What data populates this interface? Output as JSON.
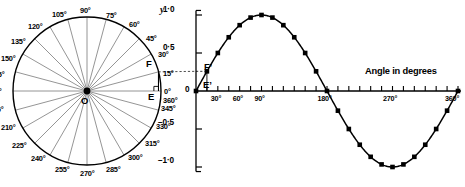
{
  "figure": {
    "width": 465,
    "height": 187,
    "background": "#ffffff",
    "ink": "#000000",
    "spoke_color": "#7a7a7a"
  },
  "circle_diagram": {
    "center_label": "O",
    "center": {
      "x": 87,
      "y": 91
    },
    "radius": 74,
    "spoke_step_degrees": 15,
    "point_labels": [
      {
        "name": "F",
        "text": "F"
      },
      {
        "name": "E",
        "text": "E"
      }
    ],
    "right_angle_marker": true,
    "angle_labels": [
      {
        "value": 0,
        "text": "0°",
        "x": 164,
        "y": 88
      },
      {
        "value": 15,
        "text": "15°",
        "x": 163,
        "y": 70
      },
      {
        "value": 30,
        "text": "30°",
        "x": 158,
        "y": 51
      },
      {
        "value": 45,
        "text": "45°",
        "x": 146,
        "y": 35
      },
      {
        "value": 60,
        "text": "60°",
        "x": 129,
        "y": 21
      },
      {
        "value": 75,
        "text": "75°",
        "x": 106,
        "y": 12
      },
      {
        "value": 90,
        "text": "90°",
        "x": 80,
        "y": 7
      },
      {
        "value": 105,
        "text": "105°",
        "x": 52,
        "y": 11
      },
      {
        "value": 120,
        "text": "120°",
        "x": 28,
        "y": 23
      },
      {
        "value": 135,
        "text": "135°",
        "x": 11,
        "y": 38
      },
      {
        "value": 150,
        "text": "150°",
        "x": 1,
        "y": 55
      },
      {
        "value": 165,
        "text": "165°",
        "x": -10,
        "y": 71
      },
      {
        "value": 180,
        "text": "180°",
        "x": -13,
        "y": 88
      },
      {
        "value": 195,
        "text": "195°",
        "x": -11,
        "y": 106
      },
      {
        "value": 210,
        "text": "210°",
        "x": 1,
        "y": 124
      },
      {
        "value": 225,
        "text": "225°",
        "x": 12,
        "y": 142
      },
      {
        "value": 240,
        "text": "240°",
        "x": 31,
        "y": 155
      },
      {
        "value": 255,
        "text": "255°",
        "x": 55,
        "y": 166
      },
      {
        "value": 270,
        "text": "270°",
        "x": 80,
        "y": 170
      },
      {
        "value": 285,
        "text": "285°",
        "x": 106,
        "y": 166
      },
      {
        "value": 300,
        "text": "300°",
        "x": 128,
        "y": 154
      },
      {
        "value": 315,
        "text": "315°",
        "x": 145,
        "y": 140
      },
      {
        "value": 330,
        "text": "330°",
        "x": 156,
        "y": 123
      },
      {
        "value": 345,
        "text": "345°",
        "x": 161,
        "y": 105
      },
      {
        "value": 360,
        "text": "360°",
        "x": 163,
        "y": 97
      }
    ]
  },
  "chart_data": {
    "type": "line",
    "title": "",
    "xlabel": "Angle in degrees",
    "ylabel": "y",
    "xlim": [
      0,
      360
    ],
    "ylim": [
      -1.0,
      1.0
    ],
    "grid": false,
    "legend": null,
    "x_tick_step": 15,
    "x_labeled_ticks": [
      {
        "value": 30,
        "text": "30°"
      },
      {
        "value": 60,
        "text": "60°"
      },
      {
        "value": 90,
        "text": "90°"
      },
      {
        "value": 180,
        "text": "180°"
      },
      {
        "value": 270,
        "text": "270°"
      },
      {
        "value": 360,
        "text": "360°"
      }
    ],
    "y_ticks": [
      {
        "value": 1.0,
        "text": "1·0"
      },
      {
        "value": 0.5,
        "text": "0·5"
      },
      {
        "value": 0.0,
        "text": "0"
      },
      {
        "value": -0.5,
        "text": "−0·5"
      },
      {
        "value": -1.0,
        "text": "−1·0"
      }
    ],
    "series": [
      {
        "name": "sine",
        "marker": "filled-square",
        "x": [
          0,
          15,
          30,
          45,
          60,
          75,
          90,
          105,
          120,
          135,
          150,
          165,
          180,
          195,
          210,
          225,
          240,
          255,
          270,
          285,
          300,
          315,
          330,
          345,
          360
        ],
        "values": [
          0.0,
          0.259,
          0.5,
          0.707,
          0.866,
          0.966,
          1.0,
          0.966,
          0.866,
          0.707,
          0.5,
          0.259,
          0.0,
          -0.259,
          -0.5,
          -0.707,
          -0.866,
          -0.966,
          -1.0,
          -0.966,
          -0.866,
          -0.707,
          -0.5,
          -0.259,
          0.0
        ]
      }
    ],
    "annotations": [
      {
        "name": "F-prime",
        "text": "F’",
        "x_deg": 15,
        "y_val": 0.259
      },
      {
        "name": "E-prime",
        "text": "E’",
        "x_deg": 15,
        "y_val": 0.0
      }
    ]
  }
}
